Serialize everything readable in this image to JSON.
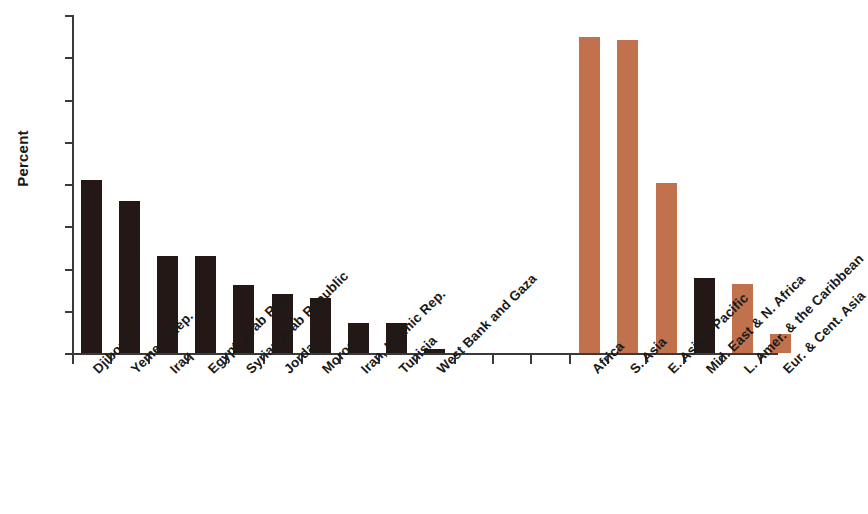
{
  "chart_data": {
    "type": "bar",
    "title": "",
    "subtitle": "",
    "xlabel": "",
    "ylabel": "Percent",
    "ylim": [
      0,
      80
    ],
    "ytick_values": [
      0,
      10,
      20,
      30,
      40,
      50,
      60,
      70,
      80
    ],
    "ytick_labels": [
      "0",
      "10",
      "20",
      "30",
      "40",
      "50",
      "60",
      "70",
      "80"
    ],
    "grid": false,
    "legend": "none",
    "groups": [
      {
        "name": "countries",
        "categories": [
          "Djibouti",
          "Yemen, Rep.",
          "Iraq",
          "Egypt, Arab Rep.",
          "Syrian Arab Republic",
          "Jordan",
          "Morocco",
          "Iran, Islamic Rep.",
          "Tunisia",
          "West Bank and Gaza"
        ],
        "values": [
          41,
          36,
          23,
          23,
          16,
          14,
          13,
          7,
          7,
          1
        ],
        "color": "#231815"
      },
      {
        "name": "regions",
        "categories": [
          "Africa",
          "S. Asia",
          "E. Asia & Pacific",
          "Mid. East & N. Africa",
          "L. Amer. & the Caribbean",
          "Eur. & Cent. Asia"
        ],
        "values": [
          74.8,
          74.2,
          40.2,
          17.8,
          16.4,
          4.4
        ],
        "colors": [
          "#c1714c",
          "#c1714c",
          "#c1714c",
          "#231815",
          "#c1714c",
          "#c1714c"
        ]
      }
    ],
    "colors": {
      "country_bar": "#231815",
      "region_bar": "#c1714c",
      "axis": "#3a3a3a",
      "text": "#1a1a1a",
      "background": "#ffffff"
    }
  }
}
